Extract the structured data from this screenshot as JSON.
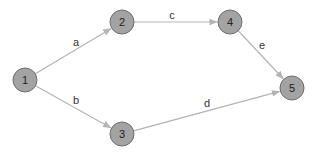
{
  "graph": {
    "type": "directed",
    "colors": {
      "node_fill": "#a3a3a3",
      "node_stroke": "#6e6e6e",
      "edge": "#b4b4b4",
      "text": "#222222",
      "background": "#ffffff"
    },
    "nodes": [
      {
        "id": "1",
        "label": "1",
        "x": 25,
        "y": 80
      },
      {
        "id": "2",
        "label": "2",
        "x": 122,
        "y": 22
      },
      {
        "id": "3",
        "label": "3",
        "x": 122,
        "y": 134
      },
      {
        "id": "4",
        "label": "4",
        "x": 230,
        "y": 22
      },
      {
        "id": "5",
        "label": "5",
        "x": 292,
        "y": 88
      }
    ],
    "edges": [
      {
        "id": "a",
        "label": "a",
        "from": "1",
        "to": "2",
        "lx": 76,
        "ly": 46
      },
      {
        "id": "b",
        "label": "b",
        "from": "1",
        "to": "3",
        "lx": 76,
        "ly": 104
      },
      {
        "id": "c",
        "label": "c",
        "from": "2",
        "to": "4",
        "lx": 172,
        "ly": 19
      },
      {
        "id": "d",
        "label": "d",
        "from": "3",
        "to": "5",
        "lx": 207,
        "ly": 107
      },
      {
        "id": "e",
        "label": "e",
        "from": "4",
        "to": "5",
        "lx": 262,
        "ly": 49
      }
    ]
  }
}
